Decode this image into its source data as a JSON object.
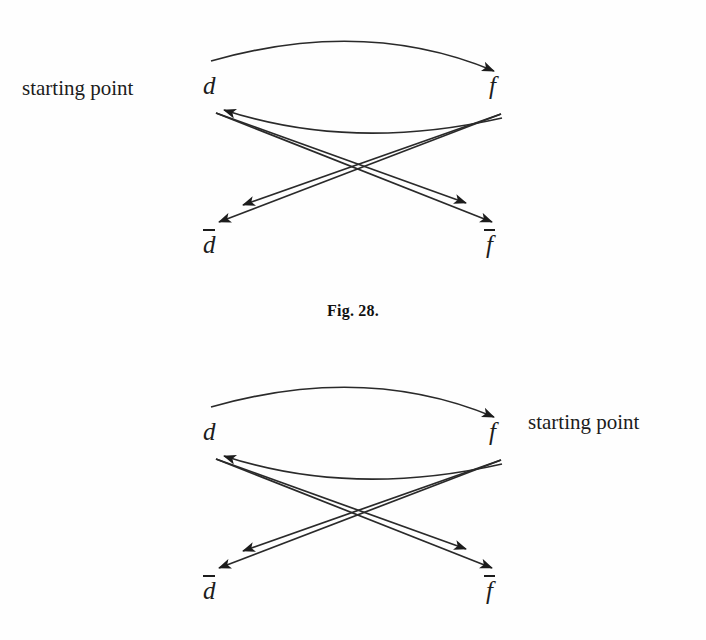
{
  "document": {
    "background_color": "#fefefe",
    "ink_color": "#1c1c1c",
    "page_width": 706,
    "page_height": 640
  },
  "caption": {
    "text": "Fig. 28."
  },
  "figures": [
    {
      "id": "figure-1",
      "annotation": {
        "text": "starting point",
        "position": "left",
        "points_to_node": "d"
      },
      "nodes": [
        {
          "id": "d",
          "label": "d",
          "overline": false,
          "position": "top-left"
        },
        {
          "id": "f",
          "label": "f",
          "overline": false,
          "position": "top-right"
        },
        {
          "id": "d_bar",
          "label": "d",
          "overline": true,
          "position": "bottom-left"
        },
        {
          "id": "f_bar",
          "label": "f",
          "overline": true,
          "position": "bottom-right"
        }
      ],
      "edges": [
        {
          "from": "d",
          "to": "f",
          "shape": "arc-above",
          "arrowheads": 1
        },
        {
          "from": "f",
          "to": "d",
          "shape": "arc-below",
          "arrowheads": 1
        },
        {
          "from": "f",
          "to": "d_bar",
          "shape": "straight",
          "arrowheads": 2
        },
        {
          "from": "d",
          "to": "f_bar",
          "shape": "straight",
          "arrowheads": 2
        }
      ]
    },
    {
      "id": "figure-2",
      "annotation": {
        "text": "starting point",
        "position": "right",
        "points_to_node": "f"
      },
      "nodes": [
        {
          "id": "d",
          "label": "d",
          "overline": false,
          "position": "top-left"
        },
        {
          "id": "f",
          "label": "f",
          "overline": false,
          "position": "top-right"
        },
        {
          "id": "d_bar",
          "label": "d",
          "overline": true,
          "position": "bottom-left"
        },
        {
          "id": "f_bar",
          "label": "f",
          "overline": true,
          "position": "bottom-right"
        }
      ],
      "edges": [
        {
          "from": "d",
          "to": "f",
          "shape": "arc-above",
          "arrowheads": 1
        },
        {
          "from": "f",
          "to": "d",
          "shape": "arc-below",
          "arrowheads": 1
        },
        {
          "from": "f",
          "to": "d_bar",
          "shape": "straight",
          "arrowheads": 2
        },
        {
          "from": "d",
          "to": "f_bar",
          "shape": "straight",
          "arrowheads": 2
        }
      ]
    }
  ]
}
